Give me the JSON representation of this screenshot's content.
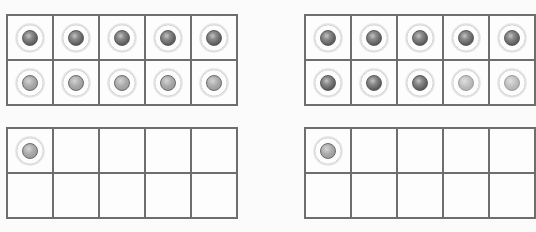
{
  "colors": {
    "frame_border": "#6e6e6e",
    "background": "#fbfbfb",
    "counter_dark": "#5c5c5c",
    "counter_light": "#aaaaaa"
  },
  "ten_frames": [
    {
      "id": "left-top",
      "position": "left",
      "row": "top",
      "filled": 10,
      "cells": [
        "dark",
        "dark",
        "dark",
        "dark",
        "dark",
        "light",
        "light",
        "light",
        "light",
        "light"
      ]
    },
    {
      "id": "right-top",
      "position": "right",
      "row": "top",
      "filled": 10,
      "cells": [
        "dark",
        "dark",
        "dark",
        "dark",
        "dark",
        "dark",
        "dark",
        "dark",
        "pale",
        "pale"
      ]
    },
    {
      "id": "left-bottom",
      "position": "left",
      "row": "bottom",
      "filled": 1,
      "cells": [
        "light",
        "",
        "",
        "",
        "",
        "",
        "",
        "",
        "",
        ""
      ]
    },
    {
      "id": "right-bottom",
      "position": "right",
      "row": "bottom",
      "filled": 1,
      "cells": [
        "light",
        "",
        "",
        "",
        "",
        "",
        "",
        "",
        "",
        ""
      ]
    }
  ]
}
